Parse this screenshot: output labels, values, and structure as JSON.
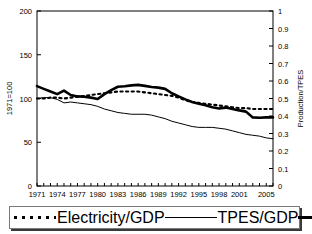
{
  "chart_data": {
    "type": "line",
    "title": "",
    "xlabel": "",
    "ylabel": "1971=100",
    "y2label": "Production/TPES",
    "xlim": [
      1971,
      2006
    ],
    "ylim": [
      0,
      200
    ],
    "y2lim": [
      0,
      1
    ],
    "grid": false,
    "legend_position": "bottom",
    "x": [
      1971,
      1972,
      1973,
      1974,
      1975,
      1976,
      1977,
      1978,
      1979,
      1980,
      1981,
      1982,
      1983,
      1984,
      1985,
      1986,
      1987,
      1988,
      1989,
      1990,
      1991,
      1992,
      1993,
      1994,
      1995,
      1996,
      1997,
      1998,
      1999,
      2000,
      2001,
      2002,
      2003,
      2004,
      2005,
      2006
    ],
    "xticks": [
      1971,
      1974,
      1977,
      1980,
      1983,
      1986,
      1989,
      1992,
      1995,
      1998,
      2001,
      2005
    ],
    "yticks": [
      0,
      50,
      100,
      150,
      200
    ],
    "y2ticks": [
      0,
      0.1,
      0.2,
      0.3,
      0.4,
      0.5,
      0.6,
      0.7,
      0.8,
      0.9,
      1
    ],
    "series": [
      {
        "name": "Electricity/GDP",
        "style": "dotted",
        "axis": "left",
        "values": [
          100,
          100,
          101,
          101,
          100,
          101,
          102,
          103,
          104,
          105,
          106,
          107,
          108,
          108,
          108,
          108,
          107,
          106,
          105,
          104,
          103,
          101,
          98,
          96,
          95,
          94,
          93,
          92,
          91,
          90,
          89,
          89,
          88,
          88,
          88,
          88
        ]
      },
      {
        "name": "TPES/GDP",
        "style": "thin-solid",
        "axis": "left",
        "values": [
          100,
          101,
          101,
          99,
          95,
          96,
          95,
          94,
          93,
          91,
          88,
          86,
          84,
          83,
          82,
          82,
          82,
          81,
          79,
          77,
          74,
          72,
          70,
          68,
          67,
          67,
          67,
          66,
          65,
          63,
          61,
          59,
          58,
          57,
          55,
          54
        ]
      },
      {
        "name": "Production/TPES",
        "style": "thick-solid",
        "axis": "right",
        "values": [
          0.571,
          0.555,
          0.54,
          0.525,
          0.545,
          0.52,
          0.512,
          0.51,
          0.505,
          0.497,
          0.525,
          0.548,
          0.567,
          0.57,
          0.575,
          0.578,
          0.572,
          0.566,
          0.562,
          0.555,
          0.53,
          0.512,
          0.495,
          0.48,
          0.47,
          0.462,
          0.45,
          0.443,
          0.448,
          0.44,
          0.432,
          0.425,
          0.392,
          0.39,
          0.392,
          0.392
        ]
      }
    ]
  },
  "axes": {
    "left_title": "1971=100",
    "right_title": "Production/TPES",
    "left_tick_labels": [
      "0",
      "50",
      "100",
      "150",
      "200"
    ],
    "right_tick_labels": [
      "0",
      "0.1",
      "0.2",
      "0.3",
      "0.4",
      "0.5",
      "0.6",
      "0.7",
      "0.8",
      "0.9",
      "1"
    ],
    "x_tick_labels": [
      "1971",
      "1974",
      "1977",
      "1980",
      "1983",
      "1986",
      "1989",
      "1992",
      "1995",
      "1998",
      "2001",
      "2005"
    ]
  },
  "legend": {
    "items": [
      {
        "label": "Electricity/GDP",
        "style": "dotted"
      },
      {
        "label": "TPES/GDP",
        "style": "thin-solid"
      },
      {
        "label": "Production/TPES",
        "style": "thick-solid"
      }
    ]
  }
}
